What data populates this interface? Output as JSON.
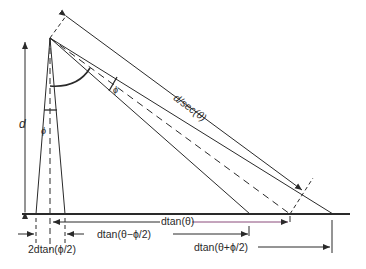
{
  "diagram": {
    "colors": {
      "line": "#2a2a2a",
      "background": "#ffffff",
      "accent_line": "#8a4a7a"
    },
    "labels": {
      "height": "d",
      "beam_angle_vertical": "ϕ",
      "beam_angle_inclined": "ϕ",
      "slant_range": "d/sec(θ)",
      "center_offset": "dtan(θ)",
      "near_edge": "dtan(θ−ϕ/2)",
      "far_edge": "dtan(θ+ϕ/2)",
      "vertical_footprint": "2dtan(ϕ/2)"
    }
  }
}
